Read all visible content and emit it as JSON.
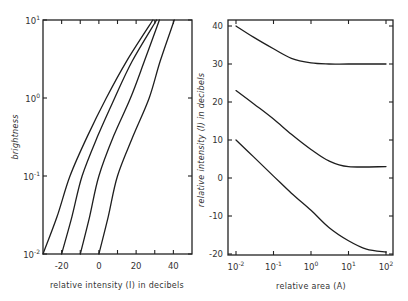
{
  "chart_data": [
    {
      "type": "line",
      "panel": "left",
      "title": "",
      "xlabel": "relative intensity (I) in decibels",
      "ylabel": "brightness",
      "xscale": "linear",
      "yscale": "log",
      "xlim": [
        -30,
        50
      ],
      "ylim": [
        0.01,
        10
      ],
      "xticks": [
        -20,
        0,
        20,
        40
      ],
      "xtick_labels": [
        "-20",
        "0",
        "20",
        "40"
      ],
      "xminor_ticks": [
        -30,
        -20,
        -10,
        0,
        10,
        20,
        30,
        40,
        50
      ],
      "yticks": [
        0.01,
        0.1,
        1,
        10
      ],
      "ytick_labels": [
        {
          "base": "10",
          "exp": "-2"
        },
        {
          "base": "10",
          "exp": "-1"
        },
        {
          "base": "10",
          "exp": "0"
        },
        {
          "base": "10",
          "exp": "1"
        }
      ],
      "grid": false,
      "legend": null,
      "series": [
        {
          "name": "curve 1",
          "points": [
            [
              -30,
              0.01
            ],
            [
              -22.5,
              0.03
            ],
            [
              -15.5,
              0.1
            ],
            [
              -6,
              0.33
            ],
            [
              4,
              1
            ],
            [
              15,
              3
            ],
            [
              29,
              10
            ]
          ]
        },
        {
          "name": "curve 2",
          "points": [
            [
              -20,
              0.01
            ],
            [
              -14.5,
              0.03
            ],
            [
              -9,
              0.1
            ],
            [
              -0.5,
              0.33
            ],
            [
              8.5,
              1
            ],
            [
              18,
              3
            ],
            [
              31,
              10
            ]
          ]
        },
        {
          "name": "curve 3",
          "points": [
            [
              -10,
              0.01
            ],
            [
              -5,
              0.03
            ],
            [
              0,
              0.1
            ],
            [
              8,
              0.33
            ],
            [
              17,
              1
            ],
            [
              24.5,
              3
            ],
            [
              32.5,
              10
            ]
          ]
        },
        {
          "name": "curve 4",
          "points": [
            [
              0,
              0.01
            ],
            [
              5,
              0.03
            ],
            [
              10,
              0.1
            ],
            [
              18.5,
              0.33
            ],
            [
              27,
              1
            ],
            [
              33,
              3
            ],
            [
              40.5,
              10
            ]
          ]
        }
      ]
    },
    {
      "type": "line",
      "panel": "right",
      "title": "",
      "xlabel": "relative area (A)",
      "ylabel": "relative intensity (I) in decibels",
      "xscale": "log",
      "yscale": "linear",
      "xlim": [
        0.0063,
        200
      ],
      "ylim": [
        -20,
        41.5
      ],
      "xticks": [
        0.01,
        0.1,
        1,
        10,
        100
      ],
      "xtick_labels": [
        {
          "base": "10",
          "exp": "-2"
        },
        {
          "base": "10",
          "exp": "-1"
        },
        {
          "base": "10",
          "exp": "0"
        },
        {
          "base": "10",
          "exp": "1"
        },
        {
          "base": "10",
          "exp": "2"
        }
      ],
      "yticks": [
        -20,
        -10,
        0,
        10,
        20,
        30,
        40
      ],
      "ytick_labels": [
        "-20",
        "-10",
        "0",
        "10",
        "20",
        "30",
        "40"
      ],
      "grid": false,
      "legend": null,
      "series": [
        {
          "name": "upper curve",
          "points": [
            [
              0.01,
              40
            ],
            [
              0.03,
              37
            ],
            [
              0.1,
              34
            ],
            [
              0.3,
              31.5
            ],
            [
              1,
              30.3
            ],
            [
              3,
              30
            ],
            [
              10,
              30
            ],
            [
              100,
              30
            ]
          ]
        },
        {
          "name": "middle curve",
          "points": [
            [
              0.01,
              23
            ],
            [
              0.03,
              19.5
            ],
            [
              0.1,
              15.5
            ],
            [
              0.3,
              11.5
            ],
            [
              1,
              7.5
            ],
            [
              3,
              4.5
            ],
            [
              10,
              3
            ],
            [
              100,
              3
            ]
          ]
        },
        {
          "name": "lower curve",
          "points": [
            [
              0.01,
              10
            ],
            [
              0.03,
              5.5
            ],
            [
              0.1,
              0.5
            ],
            [
              0.3,
              -4
            ],
            [
              1,
              -8.5
            ],
            [
              3,
              -13
            ],
            [
              10,
              -16.5
            ],
            [
              30,
              -18.7
            ],
            [
              100,
              -19.5
            ]
          ]
        }
      ]
    }
  ]
}
